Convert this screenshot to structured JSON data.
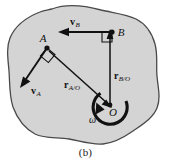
{
  "figure": {
    "caption": "(b)",
    "body_fill": "#d4d4d4",
    "body_stroke": "#4a4a4a",
    "ink": "#111111"
  },
  "points": [
    {
      "id": "A",
      "label": "A",
      "x": 47,
      "y": 48
    },
    {
      "id": "B",
      "label": "B",
      "x": 112,
      "y": 32
    },
    {
      "id": "O",
      "label": "O",
      "x": 110,
      "y": 105
    }
  ],
  "vectors": [
    {
      "id": "vA",
      "name": "velocity-a",
      "symbol": "v",
      "subscript": "A",
      "from": [
        47,
        48
      ],
      "to": [
        22,
        84
      ],
      "label_x": 33,
      "label_y": 93
    },
    {
      "id": "vB",
      "name": "velocity-b",
      "symbol": "v",
      "subscript": "B",
      "from": [
        112,
        32
      ],
      "to": [
        63,
        32
      ],
      "label_x": 70,
      "label_y": 25
    },
    {
      "id": "rAO",
      "name": "position-a-rel-o",
      "symbol": "r",
      "subscript": "A/O",
      "from": [
        47,
        48
      ],
      "to": [
        110,
        105
      ],
      "label_x": 68,
      "label_y": 86
    },
    {
      "id": "rBO",
      "name": "position-b-rel-o",
      "symbol": "r",
      "subscript": "B/O",
      "from": [
        110,
        105
      ],
      "to": [
        110,
        36
      ],
      "label_x": 114,
      "label_y": 78
    }
  ],
  "angular_velocity": {
    "symbol": "ω",
    "label_x": 93,
    "label_y": 119
  },
  "right_angles": [
    {
      "at": "A",
      "x": 47,
      "y": 48
    },
    {
      "at": "B",
      "x": 112,
      "y": 32
    }
  ]
}
